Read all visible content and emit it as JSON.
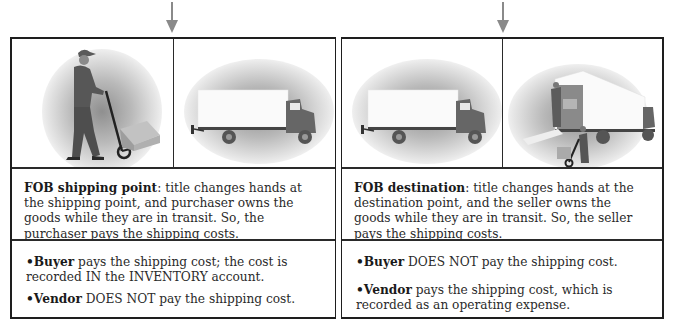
{
  "left": {
    "description": {
      "term": "FOB shipping point",
      "text": ": title changes hands at the shipping point, and purchaser owns the goods while they are in transit. So, the purchaser pays the shipping costs."
    },
    "bullets": [
      {
        "bullet": "•",
        "term": "Buyer",
        "text": " pays the shipping cost; the cost is recorded IN the INVENTORY account."
      },
      {
        "bullet": "•",
        "term": "Vendor",
        "text": " DOES NOT pay the shipping cost."
      }
    ],
    "images": [
      "worker-with-hand-truck",
      "delivery-truck"
    ]
  },
  "right": {
    "description": {
      "term": "FOB destination",
      "text": ": title changes hands at the destination point, and the seller owns the goods while they are in transit. So, the seller pays the shipping costs."
    },
    "bullets": [
      {
        "bullet": "•",
        "term": "Buyer",
        "text": " DOES NOT pay the shipping cost."
      },
      {
        "bullet": "•",
        "term": "Vendor",
        "text": " pays the shipping cost, which is recorded as an operating expense."
      }
    ],
    "images": [
      "delivery-truck",
      "truck-unloading-workers"
    ]
  },
  "colors": {
    "border": "#1e1e1e",
    "arrow": "#8a8a8a",
    "figure": "#5e5e5e",
    "box": "#a9a9a9"
  }
}
